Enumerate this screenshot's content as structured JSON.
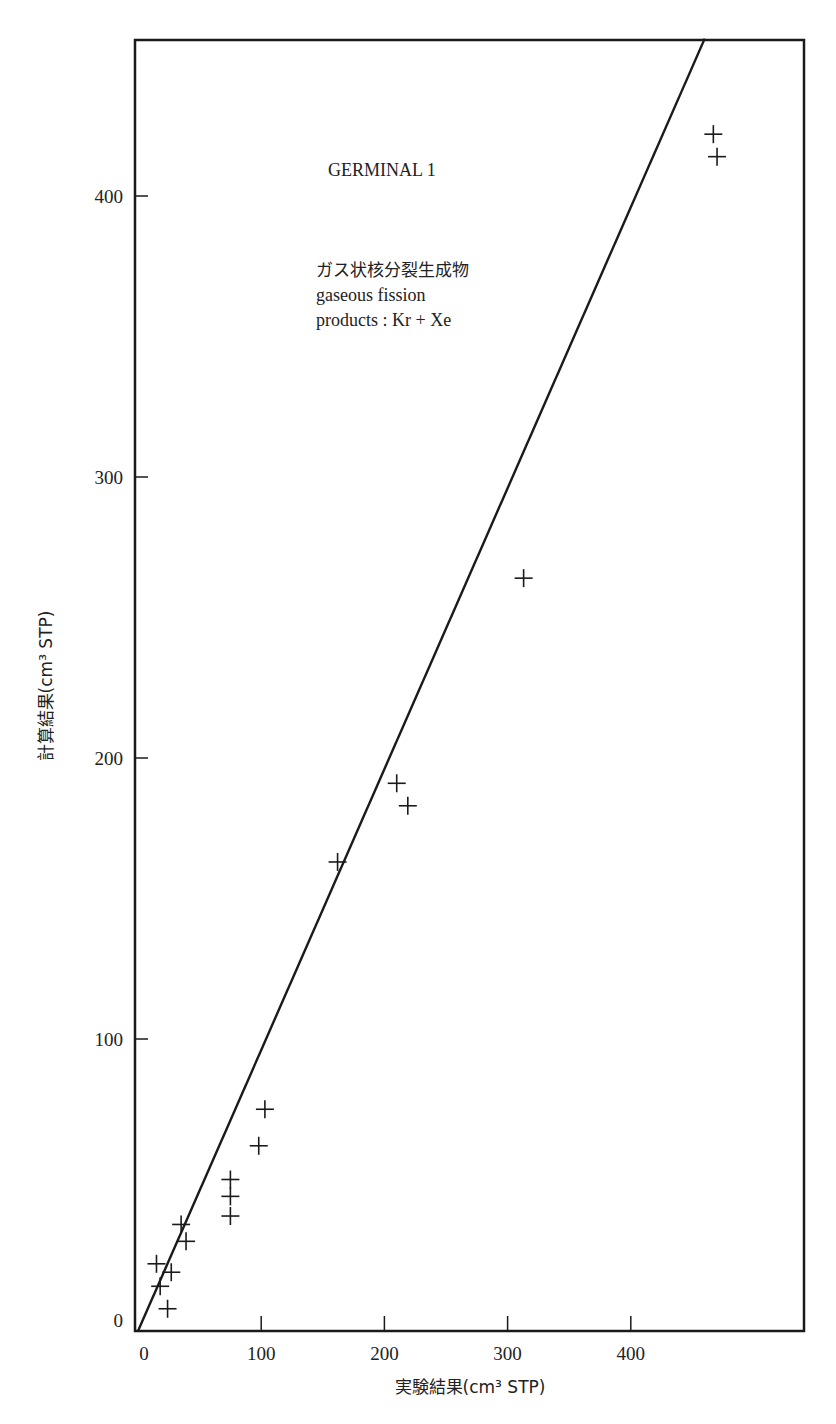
{
  "chart_data": {
    "type": "scatter",
    "title": "GERMINAL 1",
    "annotations": [
      "GERMINAL 1",
      "ガス状核分裂生成物",
      "gaseous fission",
      "products : Kr + Xe"
    ],
    "xlabel": "実験結果(cm³ STP)",
    "ylabel": "計算結果(cm³ STP)",
    "xlim": [
      0,
      540
    ],
    "ylim": [
      -4,
      455
    ],
    "xticks": [
      0,
      100,
      200,
      300,
      400
    ],
    "yticks": [
      0,
      100,
      200,
      300,
      400
    ],
    "grid": false,
    "legend": null,
    "marker": "+",
    "reference_line": {
      "label": "y = x",
      "from": [
        0,
        0
      ],
      "to": [
        460,
        456
      ]
    },
    "series": [
      {
        "name": "gaseous fission products (Kr + Xe)",
        "points": [
          [
            467,
            422
          ],
          [
            470,
            414
          ],
          [
            313,
            264
          ],
          [
            210,
            191
          ],
          [
            219,
            183
          ],
          [
            162,
            163
          ],
          [
            103,
            75
          ],
          [
            98,
            62
          ],
          [
            75,
            50
          ],
          [
            75,
            44
          ],
          [
            75,
            37
          ],
          [
            35,
            34
          ],
          [
            39,
            28
          ],
          [
            15,
            20
          ],
          [
            27,
            17
          ],
          [
            18,
            12
          ],
          [
            24,
            4
          ]
        ]
      }
    ]
  },
  "labels": {
    "title": "GERMINAL 1",
    "jp_desc": "ガス状核分裂生成物",
    "en_desc_1": "gaseous fission",
    "en_desc_2": "products : Kr + Xe",
    "xlabel": "実験結果(cm³ STP)",
    "ylabel": "計算結果(cm³ STP)"
  }
}
